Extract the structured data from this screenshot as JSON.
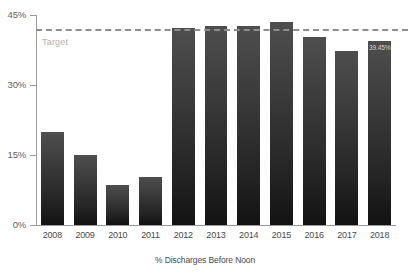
{
  "chart_data": {
    "type": "bar",
    "title": "",
    "subtitle": "",
    "xlabel": "% Discharges Before Noon",
    "ylabel": "",
    "categories": [
      "2008",
      "2009",
      "2010",
      "2011",
      "2012",
      "2013",
      "2014",
      "2015",
      "2016",
      "2017",
      "2018"
    ],
    "values": [
      20.0,
      15.0,
      8.6,
      10.2,
      42.3,
      42.6,
      42.6,
      43.6,
      40.3,
      37.3,
      39.45
    ],
    "value_labels": [
      "",
      "",
      "",
      "",
      "",
      "",
      "",
      "",
      "",
      "",
      "39.45%"
    ],
    "ylim": [
      0,
      45
    ],
    "yticks": [
      0,
      15,
      30,
      45
    ],
    "ytick_labels": [
      "0%",
      "15%",
      "30%",
      "45%"
    ],
    "grid": false,
    "legend": "none",
    "annotations": [
      {
        "name": "target",
        "label": "Target",
        "value": 42.0,
        "style": "dashed-horizontal-line"
      }
    ],
    "colors": {
      "bar_top": "#4e4e4e",
      "bar_bottom": "#121212",
      "target_line": "#8e8e8e",
      "target_label": "#b0b0b0",
      "axis": "#9a9a9a",
      "tick_text": "#5f5f5f",
      "category_text": "#4a4a4a",
      "value_label_text": "#d8d8d8",
      "background": "#ffffff"
    }
  }
}
